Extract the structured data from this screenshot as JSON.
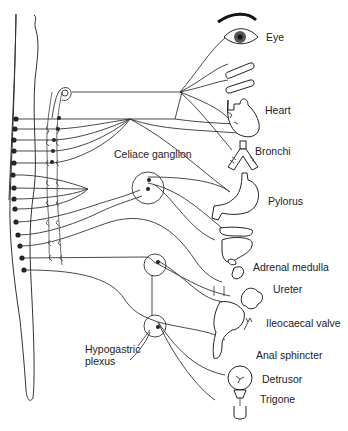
{
  "diagram": {
    "labels": {
      "eye": "Eye",
      "heart": "Heart",
      "celiac_ganglion": "Celiace ganglion",
      "bronchi": "Bronchi",
      "pylorus": "Pylorus",
      "adrenal_medulla": "Adrenal medulla",
      "ureter": "Ureter",
      "ileocaecal_valve": "Ileocaecal valve",
      "hypogastric_plexus_line1": "Hypogastric",
      "hypogastric_plexus_line2": "plexus",
      "anal_sphincter": "Anal sphincter",
      "detrusor": "Detrusor",
      "trigone": "Trigone"
    },
    "spinal_cord_dots": 14,
    "colors": {
      "line": "#333333",
      "fill": "#ffffff",
      "dot": "#222222"
    }
  }
}
